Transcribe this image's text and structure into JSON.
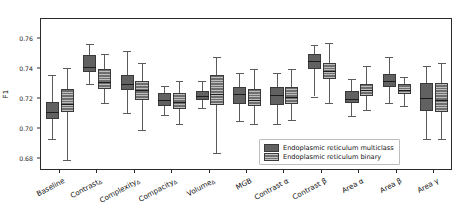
{
  "chart_data": {
    "type": "box",
    "title": "",
    "xlabel": "",
    "ylabel": "F1",
    "ylim": [
      0.672,
      0.773
    ],
    "yticks": [
      0.76,
      0.74,
      0.72,
      0.7,
      0.68
    ],
    "ytick_labels": [
      "0.76",
      "0.74",
      "0.72",
      "0.70",
      "0.68"
    ],
    "grid": false,
    "legend_position": "lower right",
    "categories": [
      "Baseline",
      "ContrastΔ",
      "ComplexityΔ",
      "CompacityΔ",
      "VolumeΔ",
      "MGB",
      "Contrast α",
      "Contrast β",
      "Area α",
      "Area β",
      "Area γ"
    ],
    "category_parts": [
      {
        "base": "Baseline",
        "sub": ""
      },
      {
        "base": "Contrast",
        "sub": "Δ"
      },
      {
        "base": "Complexity",
        "sub": "Δ"
      },
      {
        "base": "Compacity",
        "sub": "Δ"
      },
      {
        "base": "Volume",
        "sub": "Δ"
      },
      {
        "base": "MGB",
        "sub": ""
      },
      {
        "base": "Contrast α",
        "sub": ""
      },
      {
        "base": "Contrast β",
        "sub": ""
      },
      {
        "base": "Area α",
        "sub": ""
      },
      {
        "base": "Area β",
        "sub": ""
      },
      {
        "base": "Area γ",
        "sub": ""
      }
    ],
    "series": [
      {
        "name": "Endoplasmic reticulum multiclass",
        "color": "#616161",
        "hatch": "none",
        "boxes": [
          {
            "whislo": 0.6935,
            "q1": 0.7065,
            "med": 0.711,
            "q3": 0.718,
            "whishi": 0.7355
          },
          {
            "whislo": 0.73,
            "q1": 0.7375,
            "med": 0.7408,
            "q3": 0.749,
            "whishi": 0.7565
          },
          {
            "whislo": 0.7105,
            "q1": 0.7255,
            "med": 0.73,
            "q3": 0.7355,
            "whishi": 0.752
          },
          {
            "whislo": 0.7095,
            "q1": 0.715,
            "med": 0.719,
            "q3": 0.724,
            "whishi": 0.7285
          },
          {
            "whislo": 0.714,
            "q1": 0.719,
            "med": 0.722,
            "q3": 0.725,
            "whishi": 0.732
          },
          {
            "whislo": 0.705,
            "q1": 0.7165,
            "med": 0.723,
            "q3": 0.7275,
            "whishi": 0.737
          },
          {
            "whislo": 0.703,
            "q1": 0.716,
            "med": 0.7225,
            "q3": 0.728,
            "whishi": 0.737
          },
          {
            "whislo": 0.7215,
            "q1": 0.74,
            "med": 0.745,
            "q3": 0.75,
            "whishi": 0.756
          },
          {
            "whislo": 0.7085,
            "q1": 0.717,
            "med": 0.72,
            "q3": 0.725,
            "whishi": 0.733
          },
          {
            "whislo": 0.7175,
            "q1": 0.7275,
            "med": 0.732,
            "q3": 0.7365,
            "whishi": 0.7475
          },
          {
            "whislo": 0.693,
            "q1": 0.712,
            "med": 0.7205,
            "q3": 0.7305,
            "whishi": 0.742
          }
        ]
      },
      {
        "name": "Endoplasmic reticulum binary",
        "color": "#6e6e6e",
        "hatch": "horizontal",
        "boxes": [
          {
            "whislo": 0.6795,
            "q1": 0.711,
            "med": 0.7165,
            "q3": 0.7265,
            "whishi": 0.7405
          },
          {
            "whislo": 0.7175,
            "q1": 0.7265,
            "med": 0.731,
            "q3": 0.7395,
            "whishi": 0.7495
          },
          {
            "whislo": 0.699,
            "q1": 0.719,
            "med": 0.7255,
            "q3": 0.732,
            "whishi": 0.7435
          },
          {
            "whislo": 0.703,
            "q1": 0.713,
            "med": 0.718,
            "q3": 0.7235,
            "whishi": 0.732
          },
          {
            "whislo": 0.684,
            "q1": 0.716,
            "med": 0.723,
            "q3": 0.736,
            "whishi": 0.748
          },
          {
            "whislo": 0.703,
            "q1": 0.715,
            "med": 0.719,
            "q3": 0.7265,
            "whishi": 0.7395
          },
          {
            "whislo": 0.706,
            "q1": 0.7165,
            "med": 0.7215,
            "q3": 0.728,
            "whishi": 0.74
          },
          {
            "whislo": 0.717,
            "q1": 0.733,
            "med": 0.7385,
            "q3": 0.744,
            "whishi": 0.757
          },
          {
            "whislo": 0.7125,
            "q1": 0.7215,
            "med": 0.7255,
            "q3": 0.73,
            "whishi": 0.7415
          },
          {
            "whislo": 0.715,
            "q1": 0.723,
            "med": 0.726,
            "q3": 0.73,
            "whishi": 0.7345
          },
          {
            "whislo": 0.693,
            "q1": 0.711,
            "med": 0.7195,
            "q3": 0.7305,
            "whishi": 0.744
          }
        ]
      }
    ],
    "legend": [
      "Endoplasmic reticulum multiclass",
      "Endoplasmic reticulum binary"
    ]
  }
}
